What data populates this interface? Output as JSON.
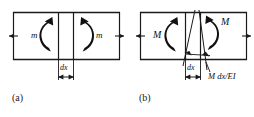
{
  "figure": {
    "stroke_color": "#1a1a1a",
    "background_color": "#ffffff",
    "panels": [
      {
        "id": "a",
        "caption": "(a)",
        "moment_symbol": "m",
        "left_moment_label": "m",
        "right_moment_label": "m",
        "dimension_label": "dx",
        "has_curvature_lines": false,
        "rotation_label": ""
      },
      {
        "id": "b",
        "caption": "(b)",
        "moment_symbol": "M",
        "left_moment_label": "M",
        "right_moment_label": "M",
        "dimension_label": "dx",
        "has_curvature_lines": true,
        "rotation_label": "M dx/EI"
      }
    ]
  }
}
